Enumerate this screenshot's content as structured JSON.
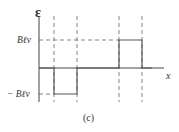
{
  "diagram": {
    "y_axis_label": "ε",
    "x_axis_label": "x",
    "positive_level_label": "Bℓv",
    "negative_level_label": "− Bℓv",
    "caption": "(c)",
    "colors": {
      "axis": "#444444",
      "signal": "#555555",
      "dashed": "#666666",
      "text": "#333333"
    },
    "signal": [
      {
        "segment": "zero",
        "x_from": "origin",
        "x_to": "x1",
        "value": "0"
      },
      {
        "segment": "negative-pulse",
        "x_from": "x1",
        "x_to": "x2",
        "value": "-Bℓv"
      },
      {
        "segment": "zero",
        "x_from": "x2",
        "x_to": "x3",
        "value": "0"
      },
      {
        "segment": "positive-pulse",
        "x_from": "x3",
        "x_to": "x4",
        "value": "Bℓv"
      },
      {
        "segment": "zero",
        "x_from": "x4",
        "x_to": "end",
        "value": "0"
      }
    ]
  }
}
